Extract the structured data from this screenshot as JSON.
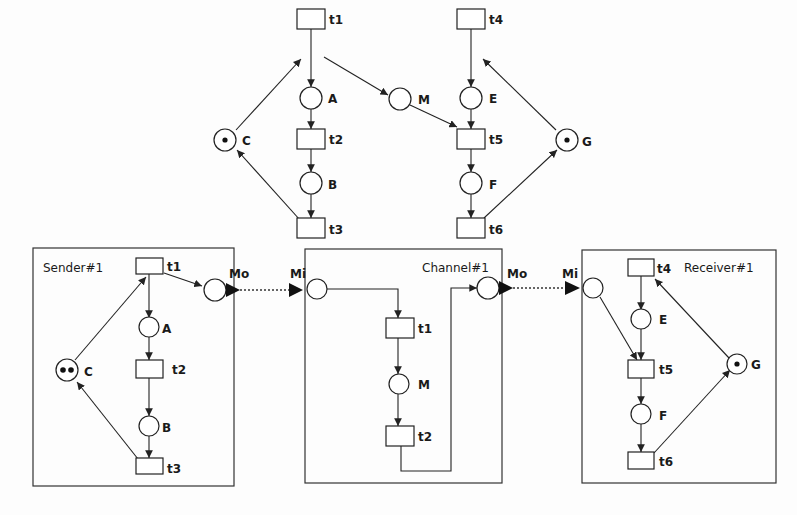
{
  "diagram": {
    "type": "petri-net",
    "top_net": {
      "places": [
        {
          "id": "A",
          "label": "A",
          "tokens": 0
        },
        {
          "id": "B",
          "label": "B",
          "tokens": 0
        },
        {
          "id": "C",
          "label": "C",
          "tokens": 1
        },
        {
          "id": "M",
          "label": "M",
          "tokens": 0
        },
        {
          "id": "E",
          "label": "E",
          "tokens": 0
        },
        {
          "id": "F",
          "label": "F",
          "tokens": 0
        },
        {
          "id": "G",
          "label": "G",
          "tokens": 1
        }
      ],
      "transitions": [
        "t1",
        "t2",
        "t3",
        "t4",
        "t5",
        "t6"
      ],
      "labels": {
        "t1": "t1",
        "t2": "t2",
        "t3": "t3",
        "t4": "t4",
        "t5": "t5",
        "t6": "t6",
        "A": "A",
        "B": "B",
        "C": "C",
        "M": "M",
        "E": "E",
        "F": "F",
        "G": "G"
      }
    },
    "sender": {
      "title": "Sender#1",
      "labels": {
        "t1": "t1",
        "t2": "t2",
        "t3": "t3",
        "A": "A",
        "B": "B",
        "C": "C",
        "Mo": "Mo"
      },
      "tokens": {
        "C": 2
      }
    },
    "channel": {
      "title": "Channel#1",
      "labels": {
        "Mi": "Mi",
        "Mo": "Mo",
        "t1": "t1",
        "t2": "t2",
        "M": "M"
      }
    },
    "receiver": {
      "title": "Receiver#1",
      "labels": {
        "Mi": "Mi",
        "t4": "t4",
        "t5": "t5",
        "t6": "t6",
        "E": "E",
        "F": "F",
        "G": "G"
      },
      "tokens": {
        "G": 1
      }
    },
    "connections": [
      {
        "from": "Sender#1.Mo",
        "to": "Channel#1.Mi",
        "style": "dotted"
      },
      {
        "from": "Channel#1.Mo",
        "to": "Receiver#1.Mi",
        "style": "dotted"
      }
    ]
  }
}
